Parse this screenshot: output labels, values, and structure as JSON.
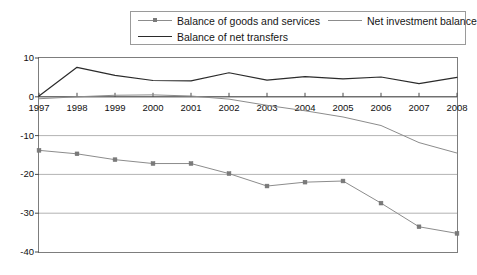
{
  "legend": {
    "entries": [
      {
        "label": "Balance of goods and services",
        "color": "#8c8c8c",
        "marker": "square",
        "marker_color": "#7a7a7a",
        "icon": "line-with-square-marker-icon"
      },
      {
        "label": "Net investment balance",
        "color": "#8c8c8c",
        "marker": "none",
        "marker_color": "",
        "icon": "plain-gray-line-icon"
      },
      {
        "label": "Balance of net transfers",
        "color": "#2b2b2b",
        "marker": "none",
        "marker_color": "",
        "icon": "plain-black-line-icon"
      }
    ]
  },
  "chart_data": {
    "type": "line",
    "title": "",
    "subtitle": "",
    "xlabel": "",
    "ylabel": "",
    "x": [
      1997,
      1998,
      1999,
      2000,
      2001,
      2002,
      2003,
      2004,
      2005,
      2006,
      2007,
      2008
    ],
    "categories": [
      "1997",
      "1998",
      "1999",
      "2000",
      "2001",
      "2002",
      "2003",
      "2004",
      "2005",
      "2006",
      "2007",
      "2008"
    ],
    "xlim": [
      1997,
      2008
    ],
    "ylim": [
      -40,
      10
    ],
    "yticks": [
      10,
      0,
      -10,
      -20,
      -30,
      -40
    ],
    "ytick_labels": [
      "10",
      "0",
      "-10",
      "-20",
      "-30",
      "-40"
    ],
    "grid": "horizontal",
    "legend_position": "top",
    "series": [
      {
        "name": "Balance of goods and services",
        "color": "#8c8c8c",
        "marker": "square",
        "values": [
          -13.8,
          -14.7,
          -16.2,
          -17.2,
          -17.2,
          -19.8,
          -23.0,
          -22.0,
          -21.7,
          -27.4,
          -33.5,
          -35.2
        ]
      },
      {
        "name": "Net investment balance",
        "color": "#8c8c8c",
        "marker": "none",
        "values": [
          -0.5,
          0.0,
          0.4,
          0.5,
          0.2,
          -0.6,
          -2.2,
          -3.6,
          -5.2,
          -7.4,
          -11.8,
          -14.5
        ]
      },
      {
        "name": "Balance of net transfers",
        "color": "#2b2b2b",
        "marker": "none",
        "values": [
          0.2,
          7.6,
          5.5,
          4.2,
          4.1,
          6.2,
          4.3,
          5.2,
          4.6,
          5.1,
          3.4,
          5.0
        ]
      }
    ]
  }
}
